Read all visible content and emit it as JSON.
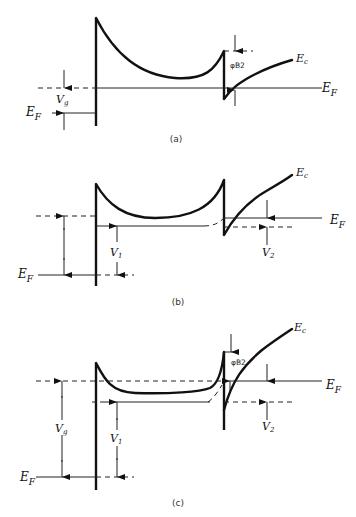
{
  "figure": {
    "panels": [
      {
        "id": "a",
        "caption": "(a)",
        "labels": {
          "conduction_band": "E",
          "conduction_band_sub": "c",
          "fermi_right": "E",
          "fermi_right_sub": "F",
          "fermi_left": "E",
          "fermi_left_sub": "F",
          "gate_voltage": "V",
          "gate_voltage_sub": "g",
          "barrier_height": "φB2"
        }
      },
      {
        "id": "b",
        "caption": "(b)",
        "labels": {
          "conduction_band": "E",
          "conduction_band_sub": "c",
          "fermi_right": "E",
          "fermi_right_sub": "F",
          "fermi_left": "E",
          "fermi_left_sub": "F",
          "voltage_1": "V",
          "voltage_1_sub": "1",
          "voltage_2": "V",
          "voltage_2_sub": "2"
        }
      },
      {
        "id": "c",
        "caption": "(c)",
        "labels": {
          "conduction_band": "E",
          "conduction_band_sub": "c",
          "fermi_right": "E",
          "fermi_right_sub": "F",
          "fermi_left": "E",
          "fermi_left_sub": "F",
          "gate_voltage": "V",
          "gate_voltage_sub": "g",
          "voltage_1": "V",
          "voltage_1_sub": "1",
          "voltage_2": "V",
          "voltage_2_sub": "2",
          "barrier_height": "φB2"
        }
      }
    ],
    "colors": {
      "ink": "#111111",
      "background": "#ffffff"
    }
  }
}
